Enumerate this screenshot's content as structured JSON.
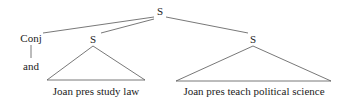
{
  "tree": {
    "root": {
      "label": "S"
    },
    "conj": {
      "label": "Conj",
      "child": "and"
    },
    "left_s": {
      "label": "S",
      "yield": "Joan pres study law"
    },
    "right_s": {
      "label": "S",
      "yield": "Joan pres teach political science"
    }
  },
  "colors": {
    "line": "#555555",
    "text": "#222222",
    "background": "#ffffff"
  }
}
